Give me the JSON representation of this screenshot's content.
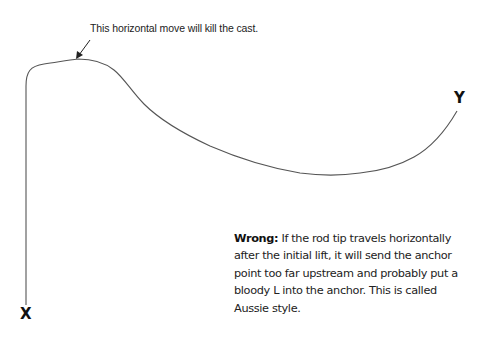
{
  "diagram": {
    "annotation": "This horizontal move will kill the cast.",
    "start_label": "X",
    "end_label": "Y",
    "stroke_color": "#555555",
    "text_color": "#222222",
    "background": "#ffffff"
  },
  "caption": {
    "lead": "Wrong:",
    "body": " If the rod tip travels horizontally after the initial lift, it will send the anchor point too far upstream and probably put a bloody L into the anchor. This is called Aussie style."
  }
}
